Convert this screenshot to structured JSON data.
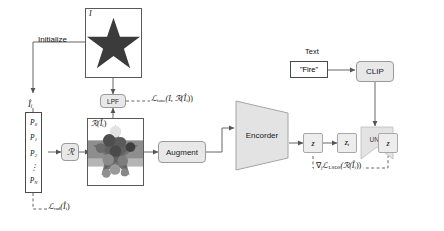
{
  "figure": {
    "type": "pipeline-diagram",
    "background": "#ffffff",
    "accent_box_fill": "#e8e8e8",
    "latent_fill": "#ededed",
    "line_color": "#555555"
  },
  "labels": {
    "initialize": "Initialize",
    "text_caption": "Text",
    "prompt_value": "\"Fire\"",
    "clip": "CLIP",
    "lpf": "LPF",
    "render_operator": "ℛ",
    "augment": "Augment",
    "encoder": "Encorder",
    "unet": "UNet",
    "latent_z": "z",
    "latent_zt": "z",
    "latent_zt_sub": "t",
    "latent_z_out": "z",
    "input_image_label": "I",
    "init_param_label": "Î",
    "init_param_sub": "i",
    "render_image_label": "ℛ(Î",
    "render_image_label_sub": "i",
    "render_image_label_close": ")"
  },
  "param_list": {
    "name": "parameter-stack",
    "items": [
      "P",
      "P",
      "P",
      "⋮",
      "P"
    ],
    "subscripts": [
      "0",
      "1",
      "2",
      "",
      "N"
    ]
  },
  "losses": {
    "tone": {
      "symbol": "ℒ",
      "subscript": "tone",
      "args": "(I, ℛ(Î",
      "args_sub": "i",
      "args_close": "))"
    },
    "rad": {
      "symbol": "ℒ",
      "subscript": "rad",
      "args": "(Î",
      "args_sub": "i",
      "args_close": ")"
    },
    "lsds": {
      "grad": "∇",
      "grad_sub": "j",
      "symbol": "ℒ",
      "subscript": "LSDS",
      "args": "(ℛ(Î",
      "args_sub": "i",
      "args_close": "))"
    }
  },
  "images": {
    "input": {
      "name": "star-silhouette-image",
      "description": "dark star silhouette on white background",
      "fill": "#3b3b3b"
    },
    "render": {
      "name": "rendered-caustic-image",
      "description": "grayscale rendered star-shaped caustic blob"
    }
  }
}
